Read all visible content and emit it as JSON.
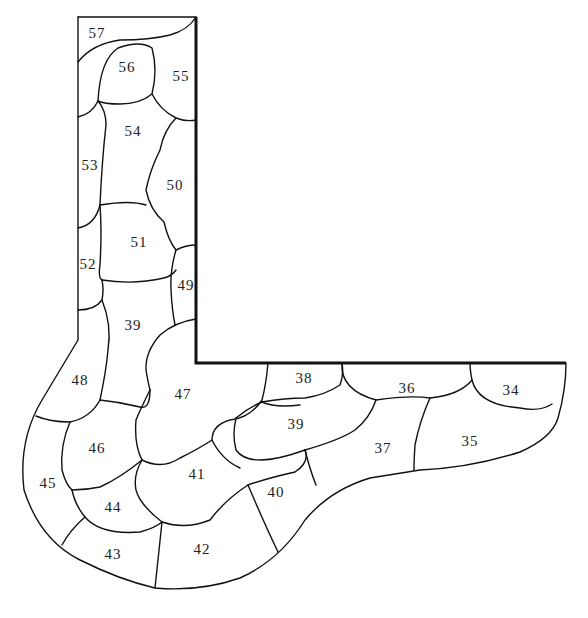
{
  "diagram": {
    "title": "",
    "colors": {
      "line": "#111111",
      "background": "#ffffff",
      "text": "#222222"
    },
    "walls": [
      "M196,17 L196,363 L566,363"
    ],
    "outer_edges": [
      "M78,17 L196,17",
      "M78,17 L78,340 Q60,370 42,400 Q18,440 24,490 Q40,540 80,560 Q120,580 155,588 Q200,592 240,578 Q280,560 305,520 Q330,490 370,478 L420,470 Q470,468 520,452 Q552,438 558,418 Q566,390 566,363"
    ],
    "joints": [
      "M78,62 Q92,44 120,40 Q150,40 170,35 Q188,30 196,17",
      "M98,101 Q100,60 118,48 Q140,40 152,48 Q158,70 152,94 Q140,104 120,104 Q104,104 98,101",
      "M78,117 Q92,114 98,101",
      "M152,94 Q160,110 176,118 Q186,122 196,120",
      "M98,101 Q106,110 106,125 Q102,160 100,205",
      "M176,118 Q164,130 160,150 Q150,170 146,190 Q150,210 164,222 Q168,240 176,250",
      "M78,228 Q95,225 100,205",
      "M100,205 Q130,200 146,205",
      "M100,205 Q102,230 100,265 Q98,278 102,280",
      "M176,250 Q186,245 196,245",
      "M176,250 Q170,270 171,290 Q172,310 175,325",
      "M102,280 Q134,285 164,278 Q172,276 176,270",
      "M78,310 Q95,310 102,300 Q104,290 102,280",
      "M102,300 Q112,325 108,350 Q106,372 100,400",
      "M196,319 Q175,322 160,335 Q145,352 146,370 Q148,382 150,390",
      "M36,416 Q50,422 70,422 Q90,418 100,400",
      "M100,400 Q120,402 140,407 Q150,410 150,390",
      "M150,390 Q140,410 136,420 Q134,445 142,460 Q162,470 180,458 Q200,448 212,440 Q212,425 230,420 Q250,418 262,400 Q266,385 268,363",
      "M70,422 Q60,445 62,470 Q66,485 72,490",
      "M142,460 Q120,478 100,487 Q86,490 72,490",
      "M72,490 Q75,505 85,517 Q100,535 140,532 Q155,528 162,522",
      "M162,522 Q140,505 136,490 Q133,475 142,460",
      "M162,522 Q185,530 210,520 Q225,500 248,485 Q268,478 295,472 Q310,462 305,450",
      "M212,440 Q222,460 240,468",
      "M62,545 Q70,530 85,517",
      "M162,522 Q158,560 155,588",
      "M248,485 Q265,525 278,552",
      "M305,450 Q310,470 316,485",
      "M236,418 Q248,408 262,402 Q285,398 305,398 Q325,395 340,385 Q344,375 342,363",
      "M262,402 Q275,408 300,405",
      "M305,450 Q340,440 355,430 Q370,418 376,400",
      "M342,363 Q340,390 376,400 Q410,395 430,398 Q460,395 472,380 Q470,370 470,363",
      "M430,398 Q420,420 415,445 Q414,460 414,470",
      "M472,380 Q478,405 520,408 Q540,412 552,404",
      "M236,418 Q232,435 236,450 Q250,470 305,450"
    ],
    "labels": [
      {
        "text": "57",
        "x": 97,
        "y": 35
      },
      {
        "text": "56",
        "x": 127,
        "y": 69
      },
      {
        "text": "55",
        "x": 181,
        "y": 78
      },
      {
        "text": "54",
        "x": 133,
        "y": 133
      },
      {
        "text": "53",
        "x": 90,
        "y": 167
      },
      {
        "text": "50",
        "x": 175,
        "y": 187
      },
      {
        "text": "51",
        "x": 139,
        "y": 244
      },
      {
        "text": "52",
        "x": 88,
        "y": 266
      },
      {
        "text": "49",
        "x": 186,
        "y": 287
      },
      {
        "text": "39",
        "x": 133,
        "y": 327
      },
      {
        "text": "48",
        "x": 80,
        "y": 382
      },
      {
        "text": "47",
        "x": 183,
        "y": 396
      },
      {
        "text": "38",
        "x": 304,
        "y": 380
      },
      {
        "text": "36",
        "x": 407,
        "y": 390
      },
      {
        "text": "34",
        "x": 511,
        "y": 392
      },
      {
        "text": "39",
        "x": 296,
        "y": 426
      },
      {
        "text": "46",
        "x": 97,
        "y": 450
      },
      {
        "text": "37",
        "x": 383,
        "y": 450
      },
      {
        "text": "35",
        "x": 470,
        "y": 443
      },
      {
        "text": "41",
        "x": 197,
        "y": 476
      },
      {
        "text": "45",
        "x": 48,
        "y": 485
      },
      {
        "text": "40",
        "x": 276,
        "y": 494
      },
      {
        "text": "44",
        "x": 113,
        "y": 509
      },
      {
        "text": "43",
        "x": 113,
        "y": 556
      },
      {
        "text": "42",
        "x": 202,
        "y": 551
      }
    ]
  }
}
